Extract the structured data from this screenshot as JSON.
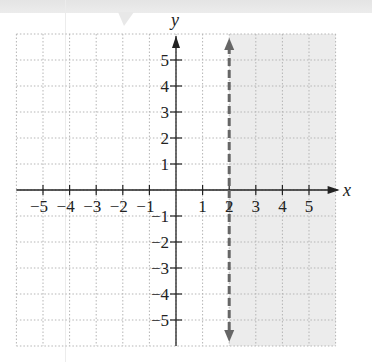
{
  "chart_data": {
    "type": "inequality-graph",
    "title": "",
    "xlabel": "x",
    "ylabel": "y",
    "xlim": [
      -6,
      6
    ],
    "ylim": [
      -6,
      6
    ],
    "grid": true,
    "x_ticks": [
      -5,
      -4,
      -3,
      -2,
      -1,
      1,
      2,
      3,
      4,
      5
    ],
    "y_ticks": [
      5,
      4,
      3,
      2,
      1,
      -1,
      -2,
      -3,
      -4,
      -5
    ],
    "x_tick_labels": [
      "−5",
      "−4",
      "−3",
      "−2",
      "−1",
      "1",
      "2",
      "3",
      "4",
      "5"
    ],
    "y_tick_labels": [
      "5",
      "4",
      "3",
      "2",
      "1",
      "−1",
      "−2",
      "−3",
      "−4",
      "−5"
    ],
    "boundary": {
      "equation": "x = 2",
      "style": "dashed",
      "color": "#666666",
      "arrows": "both"
    },
    "shaded_region": {
      "inequality": "x > 2",
      "from_x": 2,
      "to_x": 6,
      "color": "#ececec"
    }
  },
  "colors": {
    "grid": "#b5b5b5",
    "axis": "#222222",
    "shade": "#ececec",
    "boundary": "#666666",
    "top_band": "#e6e6e6"
  }
}
